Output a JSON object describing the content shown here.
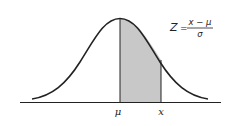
{
  "figure": {
    "type": "normal-distribution-curve",
    "shaded_region": "area between mean and x",
    "colors": {
      "curve": "#222222",
      "shade": "#c8c8c8",
      "axis": "#222222",
      "background": "#ffffff"
    }
  },
  "axis": {
    "labels": [
      {
        "id": "mu",
        "text": "μ"
      },
      {
        "id": "x",
        "text": "x"
      }
    ]
  },
  "formula": {
    "lhs": "Z",
    "equals": "=",
    "numerator": "x − μ",
    "denominator": "σ"
  }
}
